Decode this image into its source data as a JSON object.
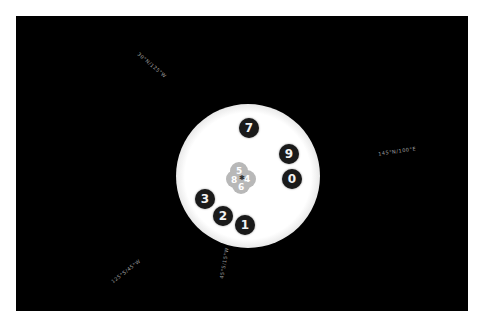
{
  "game": {
    "type": "rotary-dial-puzzle",
    "colors": {
      "frame": "#ffffff",
      "background": "#000000",
      "dial_face": "#ffffff",
      "disc": "#1a1a1a",
      "disc_text": "#f2f2f2",
      "center_cluster": "#b8b8b8",
      "coord_text": "#bdbdbd"
    },
    "dial_buttons": [
      {
        "label": "7"
      },
      {
        "label": "9"
      },
      {
        "label": "0"
      },
      {
        "label": "1"
      },
      {
        "label": "2"
      },
      {
        "label": "3"
      }
    ],
    "center_cluster": {
      "digits": [
        "5",
        "4",
        "8",
        "6"
      ],
      "mark": "✱"
    },
    "coordinate_labels": [
      {
        "text": "30°N/125°W"
      },
      {
        "text": "145°N/100°E"
      },
      {
        "text": "125°S/45°W"
      },
      {
        "text": "45°S/15°W"
      }
    ]
  }
}
